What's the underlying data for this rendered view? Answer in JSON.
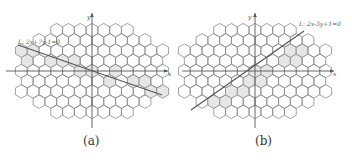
{
  "figure": {
    "hex_stroke": "#8a8a8a",
    "hex_fill_highlight": "#e6e6e6",
    "axis_color": "#555555",
    "line_color": "#555555",
    "panels": [
      {
        "id": "a",
        "caption": "(a)",
        "line_label": "L: 2x+7y-1=0",
        "x_axis_label": "x",
        "y_axis_label": "y",
        "origin": [
          92,
          71
        ],
        "line": [
          [
            18,
            45
          ],
          [
            162,
            95
          ]
        ],
        "highlighted_cells": [
          [
            -6,
            2
          ],
          [
            -5,
            2
          ],
          [
            -6,
            1
          ],
          [
            -4,
            1
          ],
          [
            -3,
            1
          ],
          [
            -2,
            1
          ],
          [
            -1,
            0
          ],
          [
            0,
            0
          ],
          [
            2,
            0
          ],
          [
            1,
            -1
          ],
          [
            3,
            -1
          ],
          [
            4,
            -1
          ],
          [
            5,
            -2
          ],
          [
            6,
            -2
          ]
        ]
      },
      {
        "id": "b",
        "caption": "(b)",
        "line_label": "L: 2x-3y+1=0",
        "x_axis_label": "x",
        "y_axis_label": "y",
        "origin": [
          79,
          71
        ],
        "line": [
          [
            15,
            110
          ],
          [
            128,
            31
          ]
        ],
        "highlighted_cells": [
          [
            -5,
            -4
          ],
          [
            -4,
            -4
          ],
          [
            -4,
            -3
          ],
          [
            -3,
            -3
          ],
          [
            -2,
            -2
          ],
          [
            -1,
            -2
          ],
          [
            -1,
            -1
          ],
          [
            0,
            -1
          ],
          [
            0,
            0
          ],
          [
            1,
            0
          ],
          [
            2,
            1
          ],
          [
            3,
            1
          ],
          [
            3,
            2
          ],
          [
            4,
            2
          ],
          [
            5,
            3
          ]
        ]
      }
    ]
  }
}
